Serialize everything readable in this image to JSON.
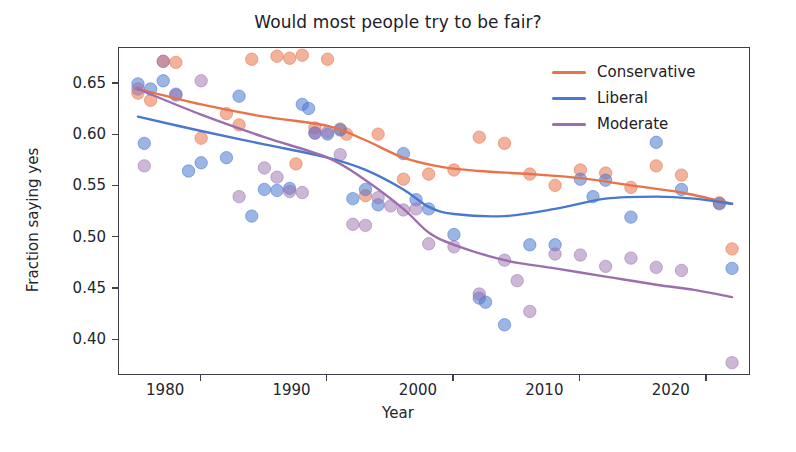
{
  "chart_data": {
    "type": "scatter",
    "title": "Would most people try to be fair?",
    "xlabel": "Year",
    "ylabel": "Fraction saying yes",
    "xlim": [
      1973.5,
      2023.5
    ],
    "ylim": [
      0.365,
      0.685
    ],
    "xticks": [
      1980,
      1990,
      2000,
      2010,
      2020
    ],
    "xticklabels": [
      "1980",
      "1990",
      "2000",
      "2010",
      "2020"
    ],
    "yticks": [
      0.4,
      0.45,
      0.5,
      0.55,
      0.6,
      0.65
    ],
    "yticklabels": [
      "0.40",
      "0.45",
      "0.50",
      "0.55",
      "0.60",
      "0.65"
    ],
    "grid": false,
    "legend_position": "upper right",
    "legend": [
      "Conservative",
      "Liberal",
      "Moderate"
    ],
    "colors": {
      "conservative": "#e8734a",
      "liberal": "#4878cf",
      "moderate": "#9b6fae",
      "frame": "#3b3f4a",
      "text": "#1d2026",
      "background": "#ffffff"
    },
    "series": [
      {
        "name": "Conservative",
        "color": "#e8734a",
        "marker_alpha": 0.55,
        "points": [
          [
            1975,
            0.641
          ],
          [
            1976,
            0.634
          ],
          [
            1977,
            0.672
          ],
          [
            1978,
            0.671
          ],
          [
            1980,
            0.597
          ],
          [
            1982,
            0.621
          ],
          [
            1983,
            0.61
          ],
          [
            1984,
            0.674
          ],
          [
            1986,
            0.677
          ],
          [
            1987,
            0.675
          ],
          [
            1987.5,
            0.572
          ],
          [
            1988,
            0.678
          ],
          [
            1989,
            0.607
          ],
          [
            1990,
            0.674
          ],
          [
            1991,
            0.606
          ],
          [
            1991.5,
            0.601
          ],
          [
            1993,
            0.541
          ],
          [
            1994,
            0.601
          ],
          [
            1996,
            0.557
          ],
          [
            1998,
            0.562
          ],
          [
            2000,
            0.566
          ],
          [
            2002,
            0.598
          ],
          [
            2004,
            0.592
          ],
          [
            2006,
            0.562
          ],
          [
            2008,
            0.551
          ],
          [
            2010,
            0.566
          ],
          [
            2012,
            0.563
          ],
          [
            2014,
            0.549
          ],
          [
            2016,
            0.57
          ],
          [
            2018,
            0.561
          ],
          [
            2021,
            0.534
          ],
          [
            2022,
            0.489
          ]
        ],
        "line": [
          [
            1975,
            0.645
          ],
          [
            1980,
            0.63
          ],
          [
            1985,
            0.618
          ],
          [
            1990,
            0.609
          ],
          [
            1993,
            0.595
          ],
          [
            1996,
            0.578
          ],
          [
            1999,
            0.569
          ],
          [
            2002,
            0.565
          ],
          [
            2006,
            0.562
          ],
          [
            2010,
            0.558
          ],
          [
            2014,
            0.551
          ],
          [
            2018,
            0.544
          ],
          [
            2022,
            0.533
          ]
        ]
      },
      {
        "name": "Liberal",
        "color": "#4878cf",
        "marker_alpha": 0.55,
        "points": [
          [
            1975,
            0.65
          ],
          [
            1975.5,
            0.592
          ],
          [
            1976,
            0.645
          ],
          [
            1977,
            0.653
          ],
          [
            1978,
            0.64
          ],
          [
            1979,
            0.565
          ],
          [
            1980,
            0.573
          ],
          [
            1982,
            0.578
          ],
          [
            1983,
            0.638
          ],
          [
            1984,
            0.521
          ],
          [
            1985,
            0.547
          ],
          [
            1986,
            0.546
          ],
          [
            1987,
            0.548
          ],
          [
            1988,
            0.63
          ],
          [
            1988.5,
            0.626
          ],
          [
            1989,
            0.602
          ],
          [
            1990,
            0.601
          ],
          [
            1991,
            0.605
          ],
          [
            1992,
            0.538
          ],
          [
            1993,
            0.547
          ],
          [
            1994,
            0.532
          ],
          [
            1996,
            0.582
          ],
          [
            1997,
            0.537
          ],
          [
            1998,
            0.528
          ],
          [
            2000,
            0.503
          ],
          [
            2002,
            0.441
          ],
          [
            2002.5,
            0.437
          ],
          [
            2004,
            0.415
          ],
          [
            2006,
            0.493
          ],
          [
            2008,
            0.493
          ],
          [
            2010,
            0.557
          ],
          [
            2011,
            0.54
          ],
          [
            2012,
            0.556
          ],
          [
            2014,
            0.52
          ],
          [
            2016,
            0.593
          ],
          [
            2018,
            0.547
          ],
          [
            2021,
            0.533
          ],
          [
            2022,
            0.47
          ]
        ],
        "line": [
          [
            1975,
            0.618
          ],
          [
            1980,
            0.604
          ],
          [
            1985,
            0.591
          ],
          [
            1990,
            0.578
          ],
          [
            1993,
            0.566
          ],
          [
            1996,
            0.547
          ],
          [
            1998,
            0.53
          ],
          [
            2000,
            0.523
          ],
          [
            2004,
            0.521
          ],
          [
            2008,
            0.528
          ],
          [
            2012,
            0.538
          ],
          [
            2016,
            0.54
          ],
          [
            2019,
            0.538
          ],
          [
            2022,
            0.533
          ]
        ]
      },
      {
        "name": "Moderate",
        "color": "#9b6fae",
        "marker_alpha": 0.5,
        "points": [
          [
            1975,
            0.645
          ],
          [
            1975.5,
            0.57
          ],
          [
            1977,
            0.672
          ],
          [
            1978,
            0.639
          ],
          [
            1980,
            0.653
          ],
          [
            1983,
            0.54
          ],
          [
            1985,
            0.568
          ],
          [
            1986,
            0.559
          ],
          [
            1987,
            0.545
          ],
          [
            1988,
            0.544
          ],
          [
            1989,
            0.602
          ],
          [
            1990,
            0.603
          ],
          [
            1991,
            0.581
          ],
          [
            1992,
            0.513
          ],
          [
            1993,
            0.512
          ],
          [
            1994,
            0.539
          ],
          [
            1995,
            0.531
          ],
          [
            1996,
            0.527
          ],
          [
            1997,
            0.528
          ],
          [
            1998,
            0.494
          ],
          [
            2000,
            0.491
          ],
          [
            2002,
            0.445
          ],
          [
            2004,
            0.478
          ],
          [
            2005,
            0.458
          ],
          [
            2006,
            0.428
          ],
          [
            2008,
            0.484
          ],
          [
            2010,
            0.483
          ],
          [
            2012,
            0.472
          ],
          [
            2014,
            0.48
          ],
          [
            2016,
            0.471
          ],
          [
            2018,
            0.468
          ],
          [
            2022,
            0.378
          ]
        ],
        "line": [
          [
            1975,
            0.645
          ],
          [
            1980,
            0.62
          ],
          [
            1985,
            0.598
          ],
          [
            1990,
            0.578
          ],
          [
            1993,
            0.556
          ],
          [
            1996,
            0.528
          ],
          [
            1998,
            0.505
          ],
          [
            2000,
            0.493
          ],
          [
            2004,
            0.478
          ],
          [
            2008,
            0.47
          ],
          [
            2012,
            0.462
          ],
          [
            2016,
            0.454
          ],
          [
            2019,
            0.449
          ],
          [
            2022,
            0.442
          ]
        ]
      }
    ]
  }
}
